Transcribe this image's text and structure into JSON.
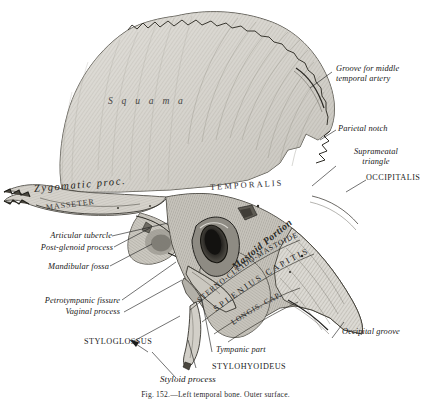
{
  "figure": {
    "title": "Left temporal bone. Outer surface.",
    "caption": "Fig. 152.—Left temporal bone. Outer surface.",
    "ink_color": "#1a1a1a",
    "bone_light": "#d8d6d0",
    "bone_mid": "#b9b6ae",
    "bone_dark": "#8d8a82",
    "paper": "#ffffff"
  },
  "in_bone_labels": {
    "squama": "S q u a m a",
    "temporalis": "TEMPORALIS",
    "mastoid_portion": "Mastoid Portion",
    "masseter": "MASSETER",
    "sterno_cleido_mastoideus": "STERNO-CLEIDO-MASTOIDEUS",
    "splenius_capitis": "SPLENIUS CAPITIS",
    "longissimus_capitis": "LONGIS. CAP."
  },
  "labels_right": [
    {
      "id": "groove-middle-temporal-artery",
      "line1": "Groove for middle",
      "line2": "temporal artery"
    },
    {
      "id": "parietal-notch",
      "line1": "Parietal notch",
      "line2": ""
    },
    {
      "id": "suprameatal-triangle",
      "line1": "Suprameatal",
      "line2": "triangle"
    },
    {
      "id": "occipitalis",
      "line1": "OCCIPITALIS",
      "line2": ""
    },
    {
      "id": "occipital-groove",
      "line1": "Occipital groove",
      "line2": ""
    }
  ],
  "labels_left": [
    {
      "id": "zygomatic-process",
      "text": "Zygomatic proc."
    },
    {
      "id": "articular-tubercle",
      "text": "Articular tubercle"
    },
    {
      "id": "post-glenoid-process",
      "text": "Post-glenoid process"
    },
    {
      "id": "mandibular-fossa",
      "text": "Mandibular fossa"
    },
    {
      "id": "petrotympanic-fissure",
      "text": "Petrotympanic fissure"
    },
    {
      "id": "vaginal-process",
      "text": "Vaginal process"
    },
    {
      "id": "styloglossus",
      "text": "STYLOGLOSSUS"
    }
  ],
  "labels_bottom": [
    {
      "id": "tympanic-part",
      "text": "Tympanic part"
    },
    {
      "id": "stylohyoideus",
      "text": "STYLOHYOIDEUS"
    },
    {
      "id": "styloid-process",
      "text": "Styloid process"
    }
  ]
}
